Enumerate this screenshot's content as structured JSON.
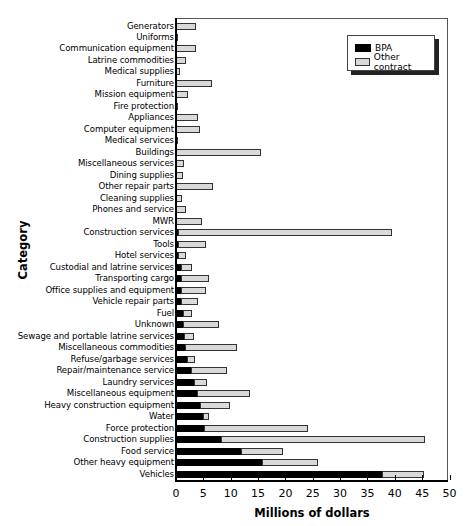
{
  "chart_data": {
    "type": "bar",
    "orientation": "horizontal",
    "stacked": true,
    "title": "",
    "xlabel": "Millions of dollars",
    "ylabel": "Category",
    "xlim": [
      0,
      50
    ],
    "xticks": [
      0,
      5,
      10,
      15,
      20,
      25,
      30,
      35,
      40,
      45,
      50
    ],
    "grid": false,
    "legend_position": "upper right",
    "categories": [
      "Generators",
      "Uniforms",
      "Communication equipment",
      "Latrine commodities",
      "Medical supplies",
      "Furniture",
      "Mission equipment",
      "Fire protection",
      "Appliances",
      "Computer equipment",
      "Medical services",
      "Buildings",
      "Miscellaneous services",
      "Dining supplies",
      "Other repair parts",
      "Cleaning supplies",
      "Phones and service",
      "MWR",
      "Construction services",
      "Tools",
      "Hotel services",
      "Custodial and latrine services",
      "Transporting cargo",
      "Office supplies and equipment",
      "Vehicle repair parts",
      "Fuel",
      "Unknown",
      "Sewage and portable latrine services",
      "Miscellaneous commodities",
      "Refuse/garbage services",
      "Repair/maintenance service",
      "Laundry services",
      "Miscellaneous equipment",
      "Heavy construction equipment",
      "Water",
      "Force protection",
      "Construction supplies",
      "Food service",
      "Other heavy equipment",
      "Vehicles"
    ],
    "series": [
      {
        "name": "BPA",
        "color": "#000000",
        "values": [
          0,
          0,
          0,
          0,
          0,
          0,
          0,
          0,
          0,
          0,
          0,
          0,
          0,
          0,
          0,
          0,
          0,
          0,
          0.3,
          0.4,
          0.4,
          0.9,
          0.9,
          0.9,
          0.9,
          1.2,
          1.2,
          1.4,
          1.6,
          2.1,
          2.7,
          3.3,
          3.8,
          4.3,
          4.9,
          5.2,
          8.2,
          11.9,
          15.8,
          37.7
        ]
      },
      {
        "name": "Other contract",
        "color": "#d9d9d9",
        "values": [
          3.7,
          0.2,
          3.7,
          1.9,
          0.7,
          6.5,
          2.2,
          0.4,
          4.1,
          4.4,
          0.2,
          15.6,
          1.5,
          1.3,
          6.8,
          1.1,
          1.8,
          4.7,
          39.1,
          5.0,
          1.4,
          2.1,
          5.2,
          4.5,
          3.1,
          1.8,
          6.6,
          1.9,
          9.5,
          1.4,
          6.6,
          2.4,
          9.8,
          5.6,
          1.2,
          19.0,
          37.4,
          7.6,
          10.1,
          7.7
        ]
      }
    ]
  },
  "legend": {
    "items": [
      {
        "label": "BPA"
      },
      {
        "label": "Other contract"
      }
    ]
  },
  "axes": {
    "x_title": "Millions of dollars",
    "y_title": "Category"
  }
}
